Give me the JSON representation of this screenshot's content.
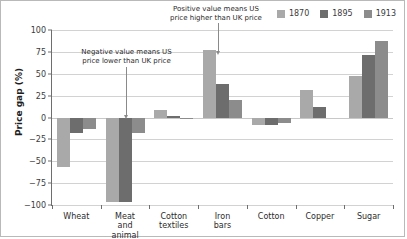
{
  "chart_data": {
    "type": "bar",
    "title": "",
    "xlabel": "",
    "ylabel": "Price gap (%)",
    "ylim": [
      -100,
      100
    ],
    "yticks": [
      100,
      75,
      50,
      25,
      0,
      -25,
      -50,
      -75,
      -100
    ],
    "ytick_labels": [
      "100",
      "75",
      "50",
      "25",
      "0",
      "−25",
      "−50",
      "−75",
      "−100"
    ],
    "grid": true,
    "legend_position": "top-right",
    "categories": [
      "Wheat",
      "Meat and\nanimal fats",
      "Cotton\ntextiles",
      "Iron bars",
      "Cotton",
      "Copper",
      "Sugar"
    ],
    "series": [
      {
        "name": "1870",
        "color": "#a9a9a9",
        "values": [
          -57,
          -97,
          9,
          77,
          -8,
          32,
          48
        ]
      },
      {
        "name": "1895",
        "color": "#6d6d6d",
        "values": [
          -18,
          -97,
          2,
          38,
          -9,
          12,
          72
        ]
      },
      {
        "name": "1913",
        "color": "#8c8c8c",
        "values": [
          -13,
          -18,
          -1,
          20,
          -6,
          0,
          88
        ]
      }
    ],
    "annotations": [
      {
        "id": "negative",
        "text": "Negative value means US\nprice lower than UK price",
        "points_to_category": "Meat and\nanimal fats"
      },
      {
        "id": "positive",
        "text": "Positive value means US\nprice higher than UK price",
        "points_to_category": "Iron bars"
      }
    ]
  },
  "legend": {
    "items": [
      {
        "label": "1870",
        "color": "#a9a9a9"
      },
      {
        "label": "1895",
        "color": "#6d6d6d"
      },
      {
        "label": "1913",
        "color": "#8c8c8c"
      }
    ]
  }
}
